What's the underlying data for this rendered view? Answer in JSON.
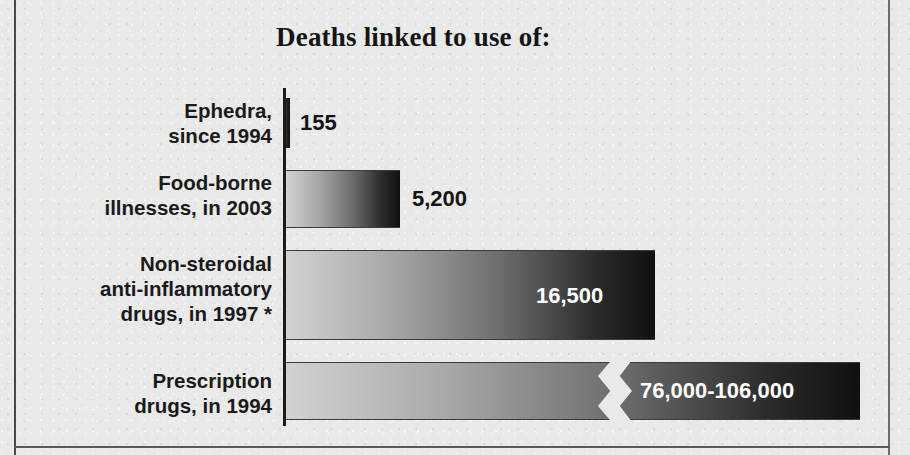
{
  "figure": {
    "title": "Deaths linked to use of:",
    "background_color": "#e9e9e9",
    "bar_gradient_from": "#d2d2d2",
    "bar_gradient_to": "#101010",
    "label_color": "#1a1a1a",
    "inside_value_color": "#ffffff"
  },
  "chart_data": {
    "type": "bar",
    "orientation": "horizontal",
    "title": "Deaths linked to use of:",
    "xlabel": "",
    "ylabel": "",
    "grid": false,
    "legend": "none",
    "axis_break": true,
    "axis_break_note": "Final bar is drawn with a zig-zag break because its value far exceeds the axis scale.",
    "footnote_marker": "*",
    "categories": [
      "Ephedra, since 1994",
      "Food-borne illnesses, in 2003",
      "Non-steroidal anti-inflammatory drugs, in 1997 *",
      "Prescription drugs, in 1994"
    ],
    "values": [
      155,
      5200,
      16500,
      91000
    ],
    "value_labels": [
      "155",
      "5,200",
      "16,500",
      "76,000-106,000"
    ],
    "value_ranges": [
      {
        "low": 155,
        "high": 155
      },
      {
        "low": 5200,
        "high": 5200
      },
      {
        "low": 16500,
        "high": 16500
      },
      {
        "low": 76000,
        "high": 106000
      }
    ],
    "xlim": [
      0,
      20000
    ]
  },
  "bars": [
    {
      "label_lines": [
        "Ephedra,",
        "since 1994"
      ],
      "value_label": "155",
      "value": 155,
      "label_placement": "outside",
      "bar_width_px": 4,
      "has_break": false,
      "row_top_px": 0,
      "row_height_px": 78,
      "bar_top_px": 10,
      "bar_height_px": 50,
      "label_top_px": 10,
      "value_left_px": 300,
      "value_top_px": 22
    },
    {
      "label_lines": [
        "Food-borne",
        "illnesses, in 2003"
      ],
      "value_label": "5,200",
      "value": 5200,
      "label_placement": "outside",
      "bar_width_px": 114,
      "has_break": false,
      "row_top_px": 78,
      "row_height_px": 83,
      "bar_top_px": 4,
      "bar_height_px": 58,
      "label_top_px": 4,
      "value_left_px": 412,
      "value_top_px": 20
    },
    {
      "label_lines": [
        "Non-steroidal",
        "anti-inflammatory",
        "drugs, in 1997 *"
      ],
      "value_label": "16,500",
      "value": 16500,
      "label_placement": "inside",
      "bar_width_px": 369,
      "has_break": false,
      "row_top_px": 161,
      "row_height_px": 111,
      "bar_top_px": 1,
      "bar_height_px": 90,
      "label_top_px": 2,
      "value_left_px": 536,
      "value_top_px": 34
    },
    {
      "label_lines": [
        "Prescription",
        "drugs, in 1994"
      ],
      "value_label": "76,000-106,000",
      "value": 91000,
      "label_placement": "inside",
      "bar_width_px": 574,
      "has_break": true,
      "break_left_px": 312,
      "row_top_px": 272,
      "row_height_px": 66,
      "bar_top_px": 2,
      "bar_height_px": 58,
      "label_top_px": 8,
      "value_left_px": 640,
      "value_top_px": 18
    }
  ]
}
